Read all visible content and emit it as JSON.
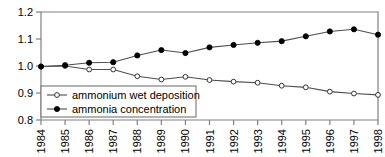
{
  "chart_data": {
    "type": "line",
    "title": "",
    "subtitle": "",
    "xlabel": "",
    "ylabel": "",
    "x": [
      1984,
      1985,
      1986,
      1987,
      1988,
      1989,
      1990,
      1991,
      1992,
      1993,
      1994,
      1995,
      1996,
      1997,
      1998
    ],
    "categories": [
      "1984",
      "1985",
      "1986",
      "1987",
      "1988",
      "1989",
      "1990",
      "1991",
      "1992",
      "1993",
      "1994",
      "1995",
      "1996",
      "1997",
      "1998"
    ],
    "xlim": [
      1984,
      1998
    ],
    "ylim": [
      0.8,
      1.2
    ],
    "yticks": [
      0.8,
      0.9,
      1.0,
      1.1,
      1.2
    ],
    "ytick_labels": [
      "0.8",
      "0.9",
      "1.0",
      "1.1",
      "1.2"
    ],
    "xticks": [
      1984,
      1985,
      1986,
      1987,
      1988,
      1989,
      1990,
      1991,
      1992,
      1993,
      1994,
      1995,
      1996,
      1997,
      1998
    ],
    "grid": false,
    "legend_position": "lower left",
    "series": [
      {
        "name": "ammonium wet deposition",
        "marker": "open-circle",
        "color": "#000000",
        "values": [
          0.998,
          1.0,
          0.987,
          0.987,
          0.962,
          0.95,
          0.96,
          0.948,
          0.942,
          0.938,
          0.927,
          0.921,
          0.905,
          0.898,
          0.893
        ]
      },
      {
        "name": "ammonia concentration",
        "marker": "filled-circle",
        "color": "#000000",
        "values": [
          0.998,
          1.003,
          1.012,
          1.014,
          1.039,
          1.059,
          1.048,
          1.069,
          1.078,
          1.086,
          1.092,
          1.11,
          1.128,
          1.136,
          1.116
        ]
      }
    ]
  },
  "legend": {
    "entries": [
      {
        "label": "ammonium wet deposition",
        "marker": "open-circle"
      },
      {
        "label": "ammonia concentration",
        "marker": "filled-circle"
      }
    ]
  },
  "axes": {
    "y_tick_labels": [
      "1.2",
      "1.1",
      "1.0",
      "0.9",
      "0.8"
    ],
    "x_tick_labels": [
      "1984",
      "1985",
      "1986",
      "1987",
      "1988",
      "1989",
      "1990",
      "1991",
      "1992",
      "1993",
      "1994",
      "1995",
      "1996",
      "1997",
      "1998"
    ]
  },
  "colors": {
    "axis": "#808080",
    "line": "#4d4d4d",
    "marker_fill": "#000000",
    "marker_open_fill": "#ffffff",
    "text": "#000000",
    "background": "#ffffff"
  }
}
